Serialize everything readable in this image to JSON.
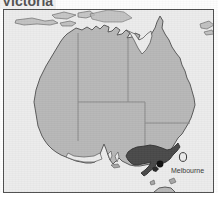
{
  "page": {
    "title": "Victoria",
    "width": 218,
    "height": 204
  },
  "title_block": {
    "label": "Victoria"
  },
  "map": {
    "frame": {
      "x": 3,
      "y": 9,
      "width": 211,
      "height": 184,
      "border_color": "#4f4f4f"
    },
    "colors": {
      "ocean": "#ececec",
      "land": "#b8b8b8",
      "highlight": "#4a4a4a",
      "coastline": "#5a5a5a",
      "state_border": "#8a8a8a",
      "city_dot": "#111111",
      "label_text": "#202020"
    },
    "region_highlighted": "Victoria",
    "city_marker": {
      "name": "Melbourne",
      "label": "Melbourne",
      "dot_x": 159,
      "dot_y": 163
    },
    "landmasses": [
      "Australia mainland",
      "Tasmania",
      "northern islands"
    ],
    "states_outlined": [
      "Western Australia",
      "Northern Territory",
      "South Australia",
      "Queensland",
      "New South Wales",
      "Victoria",
      "Tasmania"
    ]
  }
}
